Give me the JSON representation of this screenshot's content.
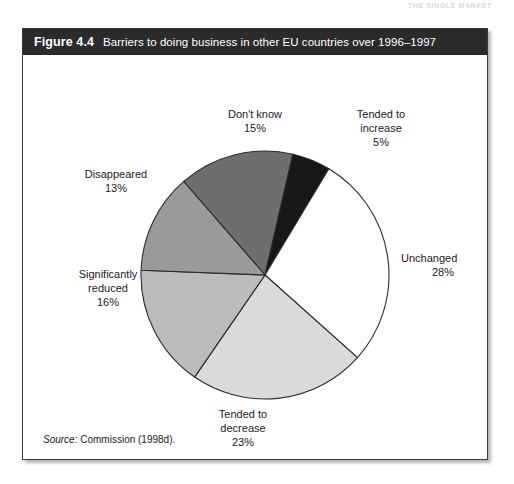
{
  "page": {
    "bleed_through_text": "THE SINGLE MARKET"
  },
  "figure": {
    "number": "Figure 4.4",
    "caption": "Barriers to doing business in other EU countries over 1996–1997",
    "source_label": "Source:",
    "source_text": "Commission (1998d)."
  },
  "chart_data": {
    "type": "pie",
    "title": "Barriers to doing business in other EU countries over 1996–1997",
    "start_angle_deg": -41,
    "direction": "clockwise",
    "legend_position": "outside-labels",
    "categories": [
      "Don't know",
      "Tended to increase",
      "Unchanged",
      "Tended to decrease",
      "Significantly reduced",
      "Disappeared"
    ],
    "values": [
      15,
      5,
      28,
      23,
      16,
      13
    ],
    "unit": "%",
    "slices": [
      {
        "label": "Don't know",
        "value": 15,
        "value_text": "15%",
        "color": "#6e6e6e"
      },
      {
        "label": "Tended to increase",
        "value": 5,
        "value_text": "5%",
        "color": "#171717"
      },
      {
        "label": "Unchanged",
        "value": 28,
        "value_text": "28%",
        "color": "#ffffff"
      },
      {
        "label": "Tended to decrease",
        "value": 23,
        "value_text": "23%",
        "color": "#dadada"
      },
      {
        "label": "Significantly reduced",
        "value": 16,
        "value_text": "16%",
        "color": "#bcbcbc"
      },
      {
        "label": "Disappeared",
        "value": 13,
        "value_text": "13%",
        "color": "#9a9a9a"
      }
    ],
    "labels": {
      "dont_know": {
        "name": "Don't know",
        "pct": "15%"
      },
      "tended_increase": {
        "name_line1": "Tended to",
        "name_line2": "increase",
        "pct": "5%"
      },
      "unchanged": {
        "name": "Unchanged",
        "pct": "28%"
      },
      "tended_decrease": {
        "name_line1": "Tended to",
        "name_line2": "decrease",
        "pct": "23%"
      },
      "significantly_reduced": {
        "name_line1": "Significantly",
        "name_line2": "reduced",
        "pct": "16%"
      },
      "disappeared": {
        "name": "Disappeared",
        "pct": "13%"
      }
    },
    "style": {
      "outline_color": "#2b2b2b",
      "header_bg": "#2b2b2b",
      "header_text": "#ffffff"
    }
  }
}
